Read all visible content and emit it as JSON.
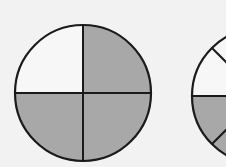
{
  "diagram": {
    "colors": {
      "background": "#f2f2f2",
      "shaded": "#a8a8a8",
      "unshaded": "#f7f7f7",
      "stroke": "#1a1a1a"
    },
    "circles": [
      {
        "name": "circle-quarters",
        "parts": 4,
        "shaded_parts": 3,
        "fraction": "3/4"
      },
      {
        "name": "circle-partial-eighths",
        "parts": 8,
        "shaded_parts_visible": "lower half",
        "note": "partially cropped at right edge"
      }
    ]
  }
}
